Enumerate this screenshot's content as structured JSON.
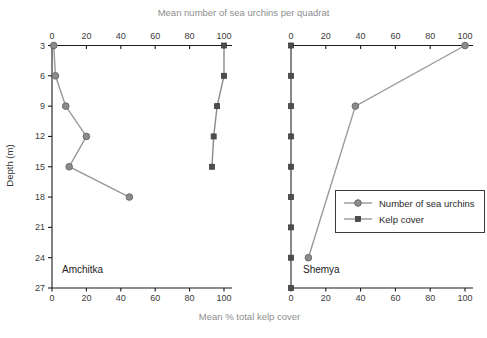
{
  "title_top": "Mean number of sea urchins per quadrat",
  "xlabel_bottom": "Mean % total kelp cover",
  "ylabel": "Depth (m)",
  "legend": {
    "items": [
      {
        "label": "Number of sea urchins",
        "marker": "circle"
      },
      {
        "label": "Kelp cover",
        "marker": "square"
      }
    ]
  },
  "colors": {
    "urchin_line": "#999999",
    "urchin_marker_fill": "#8c8c8c",
    "urchin_marker_stroke": "#6a6a6a",
    "kelp_line": "#8a8a8a",
    "kelp_marker_fill": "#4d4d4d",
    "kelp_marker_stroke": "#3d3d3d",
    "axis": "#1a1a1a",
    "tick_text": "#3a3a3a",
    "muted_text": "#8e8e8e"
  },
  "chart_data": {
    "type": "line",
    "title": "Mean number of sea urchins per quadrat",
    "xlabel": "Mean % total kelp cover",
    "ylabel": "Depth (m)",
    "xlim": [
      0,
      100
    ],
    "x_ticks": [
      0,
      20,
      40,
      60,
      80,
      100
    ],
    "ylim": [
      3,
      27
    ],
    "depth_ticks": [
      3,
      6,
      9,
      12,
      15,
      18,
      21,
      24,
      27
    ],
    "grid": false,
    "legend_position": "inside-right-panel",
    "note": "Two depth-profile panels sharing top axis (sea urchins per quadrat) and bottom axis (% total kelp cover); points are [value, depth_m]",
    "panels": [
      {
        "name": "Amchitka",
        "series": [
          {
            "name": "Number of sea urchins",
            "marker": "circle",
            "points": [
              [
                1,
                3
              ],
              [
                2,
                6
              ],
              [
                8,
                9
              ],
              [
                20,
                12
              ],
              [
                10,
                15
              ],
              [
                45,
                18
              ]
            ]
          },
          {
            "name": "Kelp cover",
            "marker": "square",
            "points": [
              [
                100,
                3
              ],
              [
                100,
                6
              ],
              [
                96,
                9
              ],
              [
                94,
                12
              ],
              [
                93,
                15
              ]
            ]
          }
        ]
      },
      {
        "name": "Shemya",
        "series": [
          {
            "name": "Number of sea urchins",
            "marker": "circle",
            "points": [
              [
                100,
                3
              ],
              [
                37,
                9
              ],
              [
                10,
                24
              ]
            ]
          },
          {
            "name": "Kelp cover",
            "marker": "square",
            "points": [
              [
                0,
                3
              ],
              [
                0,
                6
              ],
              [
                0,
                9
              ],
              [
                0,
                12
              ],
              [
                0,
                15
              ],
              [
                0,
                18
              ],
              [
                0,
                21
              ],
              [
                0,
                24
              ],
              [
                0,
                27
              ]
            ]
          }
        ]
      }
    ]
  }
}
